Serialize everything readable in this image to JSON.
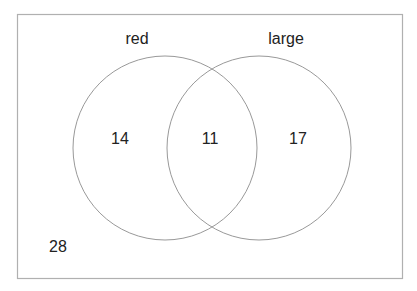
{
  "diagram": {
    "type": "venn",
    "sets": [
      {
        "name": "red",
        "only_count": "14"
      },
      {
        "name": "large",
        "only_count": "17"
      }
    ],
    "intersection_count": "11",
    "outside_count": "28",
    "colors": {
      "outline": "#999999",
      "border": "#b0b0b0",
      "text": "#222222"
    }
  }
}
